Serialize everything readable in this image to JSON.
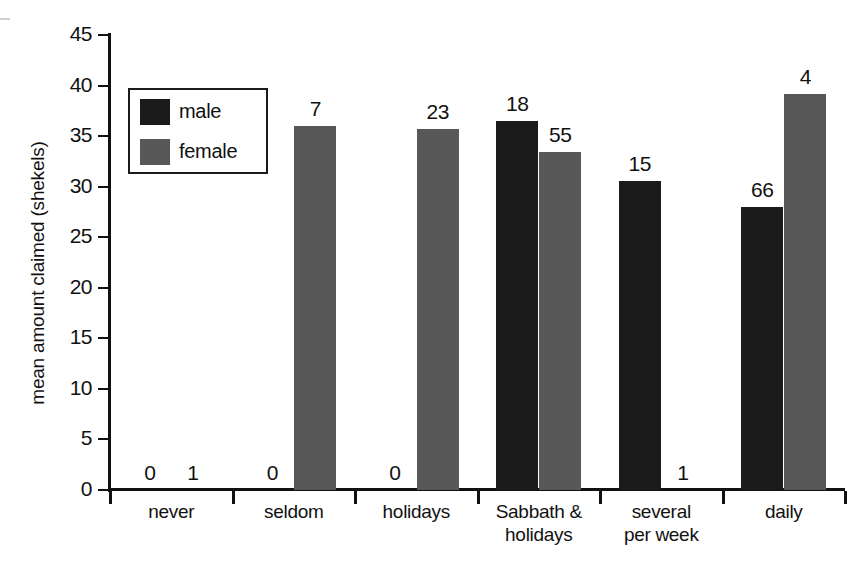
{
  "chart_data": {
    "type": "bar",
    "title": "",
    "xlabel": "",
    "ylabel": "mean amount claimed (shekels)",
    "ylim": [
      0,
      45
    ],
    "ytick_step": 5,
    "yticks": [
      0,
      5,
      10,
      15,
      20,
      25,
      30,
      35,
      40,
      45
    ],
    "ytick_labels": [
      "0",
      "5",
      "10",
      "15",
      "20",
      "25",
      "30",
      "35",
      "40",
      "45"
    ],
    "grid": false,
    "legend_position": "upper-left-inside",
    "categories": [
      "never",
      "seldom",
      "holidays",
      "Sabbath & holidays",
      "several per week",
      "daily"
    ],
    "category_lines": [
      [
        "never"
      ],
      [
        "seldom"
      ],
      [
        "holidays"
      ],
      [
        "Sabbath &",
        "holidays"
      ],
      [
        "several",
        "per week"
      ],
      [
        "daily"
      ]
    ],
    "series": [
      {
        "name": "male",
        "color": "#1b1b1b",
        "values": [
          0,
          0,
          0,
          36.5,
          30.6,
          28.0
        ],
        "point_labels": [
          "0",
          "0",
          "0",
          "18",
          "15",
          "66"
        ]
      },
      {
        "name": "female",
        "color": "#585858",
        "values": [
          0,
          36.0,
          35.7,
          33.4,
          0,
          39.2
        ],
        "point_labels": [
          "1",
          "7",
          "23",
          "55",
          "1",
          "4"
        ]
      }
    ],
    "point_label_meaning": "sample size (n) above each bar"
  },
  "legend": {
    "entries": [
      {
        "label": "male",
        "color": "#1b1b1b",
        "swatch": "filled-square"
      },
      {
        "label": "female",
        "color": "#585858",
        "swatch": "filled-square"
      }
    ]
  },
  "axis": {
    "y_title": "mean amount claimed (shekels)"
  }
}
